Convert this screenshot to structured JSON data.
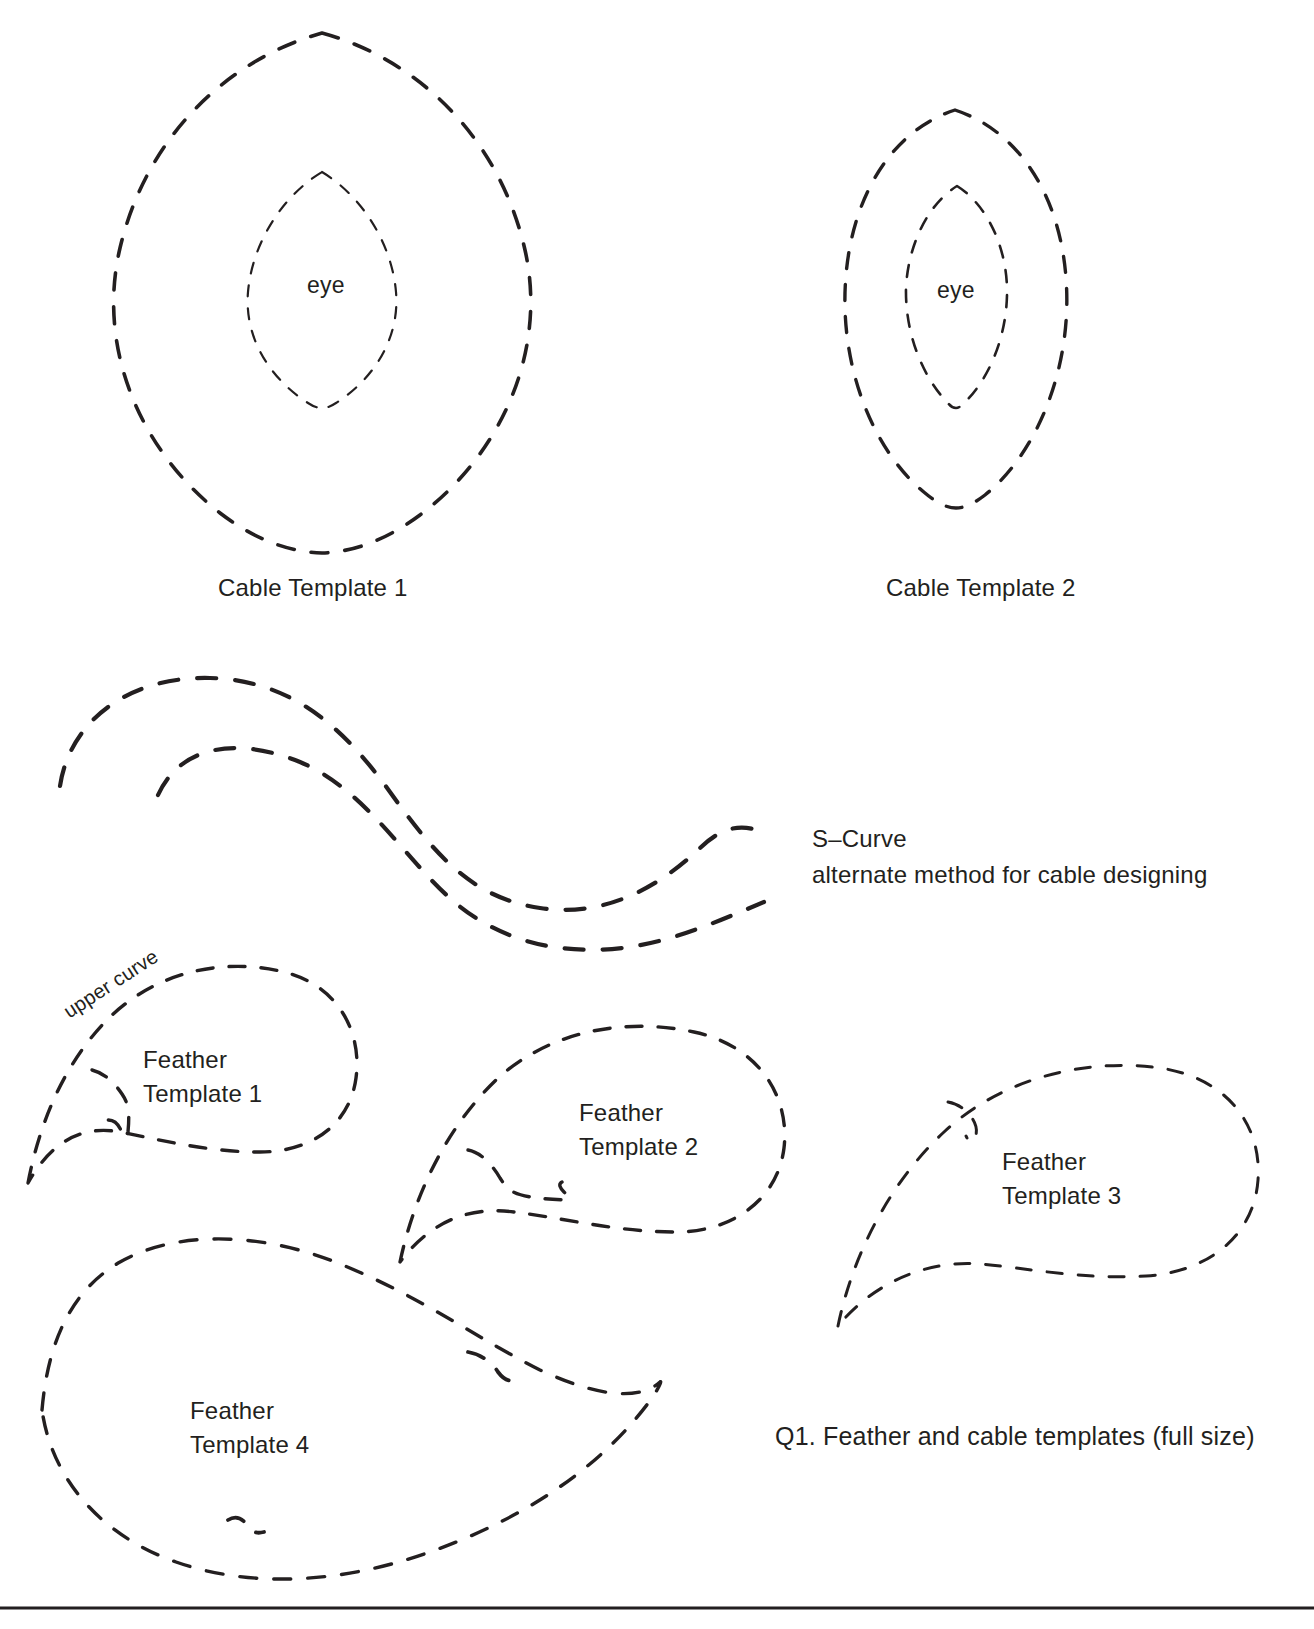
{
  "page": {
    "background_color": "#ffffff",
    "ink_color": "#231f20",
    "caption": "Q1. Feather and cable templates (full size)"
  },
  "cable_templates": [
    {
      "id": "cable-template-1",
      "label": "Cable Template 1",
      "inner_label": "eye",
      "label_x": 218,
      "label_y": 575,
      "eye_x": 307,
      "eye_y": 272
    },
    {
      "id": "cable-template-2",
      "label": "Cable Template 2",
      "inner_label": "eye",
      "label_x": 886,
      "label_y": 575,
      "eye_x": 937,
      "eye_y": 277
    }
  ],
  "s_curve": {
    "title": "S–Curve",
    "subtitle": "alternate method for cable designing",
    "title_x": 812,
    "title_y": 824,
    "subtitle_y": 860
  },
  "annotations": [
    {
      "id": "upper-curve",
      "text": "upper curve",
      "x": 72,
      "y": 1022,
      "rotation_deg": -33
    }
  ],
  "feather_templates": [
    {
      "id": "feather-template-1",
      "line1": "Feather",
      "line2": "Template 1",
      "label_x": 143,
      "label_y": 1043
    },
    {
      "id": "feather-template-2",
      "line1": "Feather",
      "line2": "Template 2",
      "label_x": 579,
      "label_y": 1096
    },
    {
      "id": "feather-template-3",
      "line1": "Feather",
      "line2": "Template 3",
      "label_x": 1002,
      "label_y": 1145
    },
    {
      "id": "feather-template-4",
      "line1": "Feather",
      "line2": "Template 4",
      "label_x": 190,
      "label_y": 1394
    }
  ],
  "caption": {
    "text": "Q1. Feather and cable templates (full size)",
    "x": 775,
    "y": 1422
  }
}
